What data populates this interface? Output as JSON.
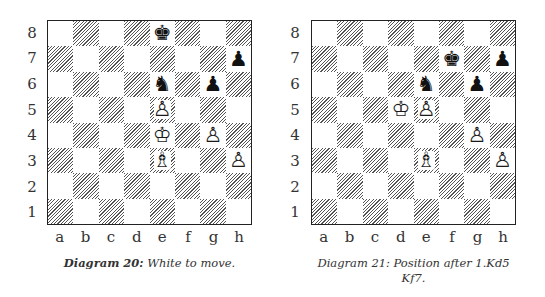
{
  "diagrams": [
    {
      "caption_bold": "Diagram 20:",
      "caption_text": "White to move.",
      "ranks": [
        "8",
        "7",
        "6",
        "5",
        "4",
        "3",
        "2",
        "1"
      ],
      "files": [
        "a",
        "b",
        "c",
        "d",
        "e",
        "f",
        "g",
        "h"
      ],
      "pieces": [
        {
          "square": "e8",
          "color": "black",
          "type": "king",
          "glyph": "♚"
        },
        {
          "square": "h7",
          "color": "black",
          "type": "pawn",
          "glyph": "♟"
        },
        {
          "square": "e6",
          "color": "black",
          "type": "knight",
          "glyph": "♞"
        },
        {
          "square": "g6",
          "color": "black",
          "type": "pawn",
          "glyph": "♟"
        },
        {
          "square": "e5",
          "color": "white",
          "type": "pawn",
          "glyph": "♙"
        },
        {
          "square": "e4",
          "color": "white",
          "type": "king",
          "glyph": "♔"
        },
        {
          "square": "g4",
          "color": "white",
          "type": "pawn",
          "glyph": "♙"
        },
        {
          "square": "e3",
          "color": "white",
          "type": "bishop",
          "glyph": "♗"
        },
        {
          "square": "h3",
          "color": "white",
          "type": "pawn",
          "glyph": "♙"
        }
      ]
    },
    {
      "caption_line1": "Diagram 21: Position after 1.Kd5",
      "caption_line2": "Kf7.",
      "ranks": [
        "8",
        "7",
        "6",
        "5",
        "4",
        "3",
        "2",
        "1"
      ],
      "files": [
        "a",
        "b",
        "c",
        "d",
        "e",
        "f",
        "g",
        "h"
      ],
      "pieces": [
        {
          "square": "f7",
          "color": "black",
          "type": "king",
          "glyph": "♚"
        },
        {
          "square": "h7",
          "color": "black",
          "type": "pawn",
          "glyph": "♟"
        },
        {
          "square": "e6",
          "color": "black",
          "type": "knight",
          "glyph": "♞"
        },
        {
          "square": "g6",
          "color": "black",
          "type": "pawn",
          "glyph": "♟"
        },
        {
          "square": "d5",
          "color": "white",
          "type": "king",
          "glyph": "♔"
        },
        {
          "square": "e5",
          "color": "white",
          "type": "pawn",
          "glyph": "♙"
        },
        {
          "square": "g4",
          "color": "white",
          "type": "pawn",
          "glyph": "♙"
        },
        {
          "square": "e3",
          "color": "white",
          "type": "bishop",
          "glyph": "♗"
        },
        {
          "square": "h3",
          "color": "white",
          "type": "pawn",
          "glyph": "♙"
        }
      ]
    }
  ]
}
